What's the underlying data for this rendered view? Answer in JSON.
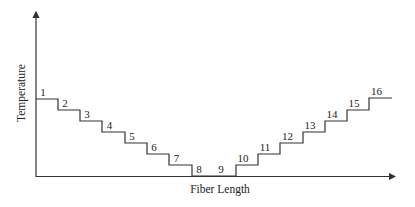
{
  "diagram": {
    "x_axis_label": "Fiber Length",
    "y_axis_label": "Temperature",
    "line_color": "#333333",
    "steps": [
      {
        "label": "1",
        "x1": 36,
        "x2": 58,
        "y": 99
      },
      {
        "label": "2",
        "x1": 58,
        "x2": 80,
        "y": 110
      },
      {
        "label": "3",
        "x1": 80,
        "x2": 102,
        "y": 121
      },
      {
        "label": "4",
        "x1": 102,
        "x2": 125,
        "y": 132
      },
      {
        "label": "5",
        "x1": 125,
        "x2": 147,
        "y": 143
      },
      {
        "label": "6",
        "x1": 147,
        "x2": 169,
        "y": 154
      },
      {
        "label": "7",
        "x1": 169,
        "x2": 192,
        "y": 165
      },
      {
        "label": "8",
        "x1": 192,
        "x2": 214,
        "y": 176
      },
      {
        "label": "9",
        "x1": 214,
        "x2": 236,
        "y": 176
      },
      {
        "label": "10",
        "x1": 236,
        "x2": 258,
        "y": 165
      },
      {
        "label": "11",
        "x1": 258,
        "x2": 280,
        "y": 154
      },
      {
        "label": "12",
        "x1": 280,
        "x2": 303,
        "y": 143
      },
      {
        "label": "13",
        "x1": 303,
        "x2": 325,
        "y": 132
      },
      {
        "label": "14",
        "x1": 325,
        "x2": 347,
        "y": 121
      },
      {
        "label": "15",
        "x1": 347,
        "x2": 369,
        "y": 110
      },
      {
        "label": "16",
        "x1": 369,
        "x2": 392,
        "y": 98
      }
    ]
  }
}
